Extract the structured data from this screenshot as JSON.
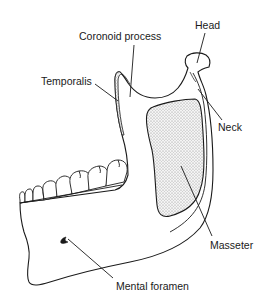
{
  "diagram": {
    "labels": {
      "head": "Head",
      "coronoid_process": "Coronoid process",
      "temporalis": "Temporalis",
      "neck": "Neck",
      "masseter": "Masseter",
      "mental_foramen": "Mental foramen"
    },
    "colors": {
      "stroke": "#1a1a1a",
      "background": "#ffffff",
      "muscle_fill": "#e6e6e6"
    }
  }
}
